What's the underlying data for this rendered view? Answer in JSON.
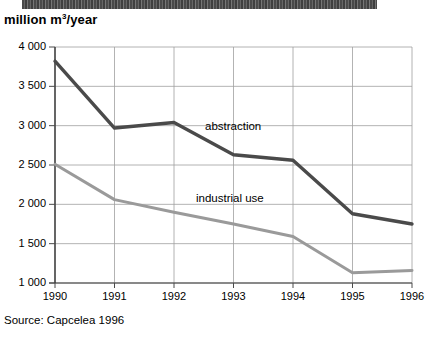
{
  "figure": {
    "unit_title": "million m",
    "unit_exponent": "3",
    "unit_title_suffix": "/year",
    "source": "Source: Capcelea 1996"
  },
  "chart_data": {
    "type": "line",
    "title": "million m3/year",
    "xlabel": "",
    "ylabel": "million m3/year",
    "categories": [
      "1990",
      "1991",
      "1992",
      "1993",
      "1994",
      "1995",
      "1996"
    ],
    "x": [
      1990,
      1991,
      1992,
      1993,
      1994,
      1995,
      1996
    ],
    "ylim": [
      1000,
      4000
    ],
    "yticks": [
      1000,
      1500,
      2000,
      2500,
      3000,
      3500,
      4000
    ],
    "ytick_labels": [
      "1 000",
      "1 500",
      "2 000",
      "2 500",
      "3 000",
      "3 500",
      "4 000"
    ],
    "grid": true,
    "legend_position": "inline-labels",
    "series": [
      {
        "name": "abstraction",
        "color": "#4a4a4a",
        "values": [
          3820,
          2970,
          3040,
          2630,
          2560,
          1880,
          1750
        ]
      },
      {
        "name": "industrial use",
        "color": "#9a9a9a",
        "values": [
          2510,
          2060,
          1900,
          1750,
          1590,
          1130,
          1160
        ]
      }
    ],
    "annotations": [
      {
        "text": "abstraction",
        "series": "abstraction"
      },
      {
        "text": "industrial use",
        "series": "industrial use"
      }
    ]
  }
}
